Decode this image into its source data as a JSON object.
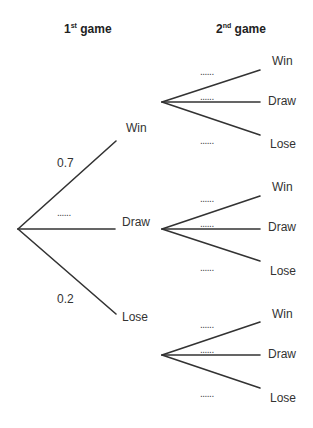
{
  "headers": {
    "first": {
      "num": "1",
      "sup": "st",
      "text": " game"
    },
    "second": {
      "num": "2",
      "sup": "nd",
      "text": " game"
    }
  },
  "first_game": {
    "branches": [
      {
        "outcome": "Win",
        "probability": "0.7"
      },
      {
        "outcome": "Draw",
        "probability": "......"
      },
      {
        "outcome": "Lose",
        "probability": "0.2"
      }
    ]
  },
  "second_game": {
    "after_win": [
      {
        "outcome": "Win",
        "probability": "......"
      },
      {
        "outcome": "Draw",
        "probability": "......"
      },
      {
        "outcome": "Lose",
        "probability": "......"
      }
    ],
    "after_draw": [
      {
        "outcome": "Win",
        "probability": "......"
      },
      {
        "outcome": "Draw",
        "probability": "......"
      },
      {
        "outcome": "Lose",
        "probability": "......"
      }
    ],
    "after_lose": [
      {
        "outcome": "Win",
        "probability": "......"
      },
      {
        "outcome": "Draw",
        "probability": "......"
      },
      {
        "outcome": "Lose",
        "probability": "......"
      }
    ]
  },
  "colors": {
    "line": "#333333",
    "text": "#333333"
  }
}
